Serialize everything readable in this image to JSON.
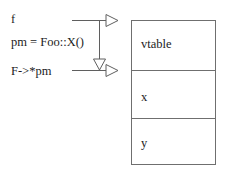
{
  "diagram": {
    "background_color": "#ffffff",
    "line_color": "#5f5f5f",
    "text_color": "#1c1c1c",
    "width": 229,
    "height": 174,
    "expressions": [
      {
        "id": "f",
        "text": "f"
      },
      {
        "id": "pm",
        "text": "pm = Foo::X()"
      },
      {
        "id": "deref",
        "text": "F->*pm"
      }
    ],
    "connectors": [
      {
        "id": "f-to-object",
        "kind": "horizontal-arrow",
        "arrowhead": "hollow-triangle-right"
      },
      {
        "id": "pm-offset",
        "kind": "vertical-arrow",
        "arrowhead": "hollow-triangle-down"
      },
      {
        "id": "deref-to-object",
        "kind": "horizontal-arrow",
        "arrowhead": "hollow-triangle-right"
      }
    ],
    "object_box": {
      "label": "object layout",
      "slots": [
        {
          "id": "vtable",
          "label": "vtable"
        },
        {
          "id": "x",
          "label": "x"
        },
        {
          "id": "y",
          "label": "y"
        }
      ]
    }
  }
}
